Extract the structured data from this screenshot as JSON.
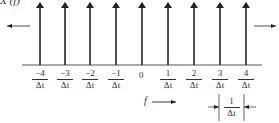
{
  "title": "X (f)",
  "axis_variable": "f",
  "tick_labels": [
    {
      "num": "−4",
      "den": "Δt"
    },
    {
      "num": "−3",
      "den": "Δt"
    },
    {
      "num": "−2",
      "den": "Δt"
    },
    {
      "num": "−1",
      "den": "Δt"
    },
    {
      "num": "0",
      "den": ""
    },
    {
      "num": "1",
      "den": "Δt"
    },
    {
      "num": "2",
      "den": "Δt"
    },
    {
      "num": "3",
      "den": "Δt"
    },
    {
      "num": "4",
      "den": "Δt"
    }
  ],
  "spacing_label": {
    "num": "1",
    "den": "Δt"
  },
  "impulse_positions_px": [
    40,
    65,
    90,
    116,
    142,
    168,
    194,
    220,
    246
  ],
  "colors": {
    "stroke": "#222222",
    "text": "#333333",
    "axis": "#555555"
  }
}
